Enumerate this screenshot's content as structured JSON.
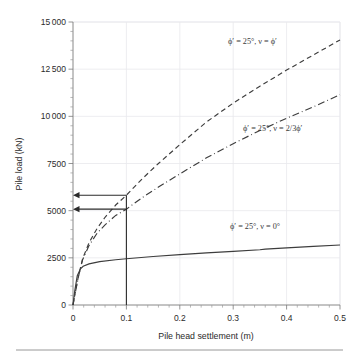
{
  "chart_data": {
    "type": "line",
    "title": "",
    "xlabel": "Pile head settlement (m)",
    "ylabel": "Pile load (kN)",
    "xlim": [
      0,
      0.5
    ],
    "ylim": [
      0,
      15000
    ],
    "grid": true,
    "legend_position": "inline-annotations",
    "x_ticks": [
      "0",
      "0.1",
      "0.2",
      "0.3",
      "0.4",
      "0.5"
    ],
    "x_tick_values": [
      0,
      0.1,
      0.2,
      0.3,
      0.4,
      0.5
    ],
    "x_minor_step": 0.02,
    "y_ticks": [
      "0",
      "2500",
      "5000",
      "7500",
      "10 000",
      "12 500",
      "15 000"
    ],
    "y_tick_values": [
      0,
      2500,
      5000,
      7500,
      10000,
      12500,
      15000
    ],
    "y_minor_step": 500,
    "series": [
      {
        "name": "phi' = 25 deg, v = phi'",
        "label": "ϕ′ = 25°, ν = ϕ′",
        "style": "dashed",
        "x": [
          0,
          0.004,
          0.01,
          0.018,
          0.03,
          0.045,
          0.06,
          0.08,
          0.1,
          0.13,
          0.16,
          0.2,
          0.25,
          0.3,
          0.35,
          0.4,
          0.45,
          0.5
        ],
        "y": [
          0,
          620,
          1500,
          2450,
          3300,
          4050,
          4650,
          5300,
          5820,
          6700,
          7500,
          8500,
          9700,
          10700,
          11600,
          12450,
          13250,
          14050
        ]
      },
      {
        "name": "phi' = 25 deg, v = 2/3 phi'",
        "label": "ϕ′ = 25°, ν = 2/3ϕ′",
        "style": "dash-dot",
        "x": [
          0,
          0.004,
          0.01,
          0.018,
          0.03,
          0.045,
          0.06,
          0.08,
          0.1,
          0.13,
          0.16,
          0.2,
          0.25,
          0.3,
          0.35,
          0.4,
          0.45,
          0.5
        ],
        "y": [
          0,
          610,
          1480,
          2400,
          3150,
          3800,
          4250,
          4750,
          5080,
          5700,
          6250,
          6950,
          7800,
          8550,
          9250,
          9900,
          10500,
          11150
        ]
      },
      {
        "name": "phi' = 25 deg, v = 0 deg",
        "label": "ϕ′ = 25°, ν = 0°",
        "style": "solid",
        "x": [
          0,
          0.003,
          0.008,
          0.014,
          0.019,
          0.03,
          0.05,
          0.08,
          0.1,
          0.15,
          0.2,
          0.25,
          0.3,
          0.35,
          0.36,
          0.4,
          0.45,
          0.5
        ],
        "y": [
          0,
          700,
          1550,
          1920,
          2050,
          2180,
          2300,
          2400,
          2450,
          2570,
          2670,
          2760,
          2840,
          2930,
          2960,
          3030,
          3110,
          3180
        ]
      }
    ],
    "construction_lines": [
      {
        "name": "vertical-marker-at-0.1",
        "type": "vertical",
        "x": 0.1,
        "y_from": 0,
        "y_to": 5820
      },
      {
        "name": "arrow-to-upper-load",
        "type": "horizontal-arrow",
        "y": 5820,
        "x_from": 0.1,
        "x_to": 0
      },
      {
        "name": "arrow-to-lower-load",
        "type": "horizontal-arrow",
        "y": 5080,
        "x_from": 0.1,
        "x_to": 0
      }
    ]
  },
  "annotations": {
    "upper": "ϕ′ = 25°, ν = ϕ′",
    "middle": "ϕ′ = 25°, ν = 2/3ϕ′",
    "lower": "ϕ′ = 25°, ν = 0°"
  },
  "colors": {
    "curve": "#3d3d3d",
    "axis": "#7a7a7a",
    "grid": "#e9e9ec",
    "text": "#2b2b2b",
    "background": "#ffffff"
  }
}
